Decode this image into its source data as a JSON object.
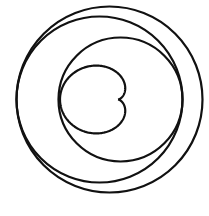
{
  "diagram": {
    "background": "#ffffff",
    "stroke_color": "#111111",
    "circles": [
      {
        "name": "outer-circle",
        "cx": 109.5,
        "cy": 99.5,
        "r": 93
      },
      {
        "name": "middle-circle",
        "cx": 99.5,
        "cy": 99.5,
        "r": 83
      },
      {
        "name": "inner-circle",
        "cx": 120.5,
        "cy": 99.5,
        "r": 62
      }
    ],
    "cardioid": {
      "name": "cardioid-curve",
      "cusp_x": 118,
      "cusp_y": 99.5,
      "a": 29,
      "y_scale": 0.9
    }
  }
}
